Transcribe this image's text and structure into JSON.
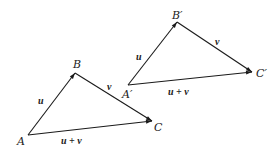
{
  "diagram": {
    "type": "vector-addition-triangles",
    "colors": {
      "stroke": "#1a1a1a",
      "text": "#222222",
      "background": "#ffffff"
    },
    "triangles": [
      {
        "id": "original",
        "vertices": {
          "A": {
            "label": "A",
            "x": 28,
            "y": 135,
            "label_x": 17,
            "label_y": 145
          },
          "B": {
            "label": "B",
            "x": 75,
            "y": 73,
            "label_x": 73,
            "label_y": 68
          },
          "C": {
            "label": "C",
            "x": 152,
            "y": 121,
            "label_x": 154,
            "label_y": 131
          }
        },
        "edges": [
          {
            "from": "A",
            "to": "B",
            "label": "u",
            "label_x": 38,
            "label_y": 104
          },
          {
            "from": "B",
            "to": "C",
            "label": "v",
            "label_x": 107,
            "label_y": 90
          },
          {
            "from": "A",
            "to": "C",
            "label": "u + v",
            "label_x": 61,
            "label_y": 144
          }
        ]
      },
      {
        "id": "translated",
        "vertices": {
          "A": {
            "label": "A′",
            "x": 128,
            "y": 85,
            "label_x": 122,
            "label_y": 98
          },
          "B": {
            "label": "B′",
            "x": 177,
            "y": 22,
            "label_x": 172,
            "label_y": 19
          },
          "C": {
            "label": "C′",
            "x": 252,
            "y": 72,
            "label_x": 256,
            "label_y": 77
          }
        },
        "edges": [
          {
            "from": "A",
            "to": "B",
            "label": "u",
            "label_x": 136,
            "label_y": 60
          },
          {
            "from": "B",
            "to": "C",
            "label": "v",
            "label_x": 215,
            "label_y": 45
          },
          {
            "from": "A",
            "to": "C",
            "label": "u + v",
            "label_x": 168,
            "label_y": 95
          }
        ]
      }
    ]
  }
}
